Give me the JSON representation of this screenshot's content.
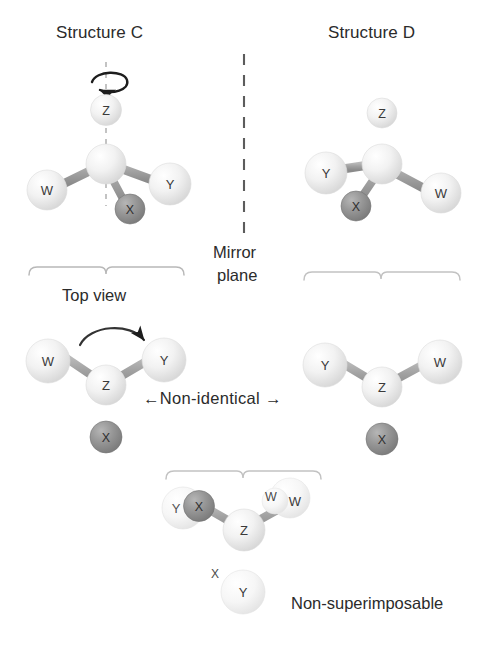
{
  "figure": {
    "title_left": "Structure C",
    "title_right": "Structure D",
    "mirror_label_line1": "Mirror",
    "mirror_label_line2": "plane",
    "top_view_label": "Top view",
    "non_identical_label": "←Non-identical →",
    "non_superimposable_label": "Non-superimposable",
    "colors": {
      "atom_light": "#ededed",
      "atom_light_edge": "#d2d2d2",
      "atom_dark": "#8d8d8d",
      "atom_dark_edge": "#6f6f6f",
      "bond": "#9a9a9a",
      "bracket": "#b4b4b4",
      "text": "#2b2b2b",
      "background": "#ffffff"
    }
  },
  "structures": {
    "structure_c_3d": {
      "name": "Structure C",
      "view": "3d",
      "center_atom": "",
      "atoms": [
        {
          "label": "Z",
          "position": "top",
          "shade": "light"
        },
        {
          "label": "W",
          "position": "left",
          "shade": "light"
        },
        {
          "label": "Y",
          "position": "right",
          "shade": "light"
        },
        {
          "label": "X",
          "position": "bottom-right-wedge",
          "shade": "dark"
        }
      ],
      "has_rotation_arrow": true,
      "has_rotation_axis": true
    },
    "structure_d_3d": {
      "name": "Structure D",
      "view": "3d",
      "center_atom": "",
      "atoms": [
        {
          "label": "Z",
          "position": "top",
          "shade": "light"
        },
        {
          "label": "Y",
          "position": "left",
          "shade": "light"
        },
        {
          "label": "W",
          "position": "right",
          "shade": "light"
        },
        {
          "label": "X",
          "position": "bottom-left-wedge",
          "shade": "dark"
        }
      ],
      "has_rotation_arrow": false,
      "has_rotation_axis": false
    },
    "structure_c_top": {
      "name": "Structure C top view",
      "view": "top",
      "center_atom": "Z",
      "atoms": [
        {
          "label": "W",
          "position": "upper-left",
          "shade": "light"
        },
        {
          "label": "Y",
          "position": "upper-right",
          "shade": "light"
        },
        {
          "label": "X",
          "position": "bottom",
          "shade": "dark"
        }
      ],
      "has_curved_arrow": true
    },
    "structure_d_top": {
      "name": "Structure D top view",
      "view": "top",
      "center_atom": "Z",
      "atoms": [
        {
          "label": "Y",
          "position": "upper-left",
          "shade": "light"
        },
        {
          "label": "W",
          "position": "upper-right",
          "shade": "light"
        },
        {
          "label": "X",
          "position": "bottom",
          "shade": "dark"
        }
      ],
      "has_curved_arrow": false
    },
    "overlay": {
      "name": "Superimposed overlay",
      "view": "top-overlay",
      "center_atom": "Z",
      "atoms": [
        {
          "label": "Y",
          "position": "upper-left-outer",
          "shade": "light"
        },
        {
          "label": "X",
          "position": "upper-left-inner",
          "shade": "dark"
        },
        {
          "label": "W",
          "position": "upper-right-outer",
          "shade": "light"
        },
        {
          "label": "W",
          "position": "upper-right-ghost",
          "shade": "light"
        },
        {
          "label": "Y",
          "position": "bottom",
          "shade": "light"
        },
        {
          "label": "X",
          "position": "bottom-ghost-label",
          "shade": "label-only"
        }
      ]
    }
  },
  "atom_labels": {
    "z": "Z",
    "w": "W",
    "x": "X",
    "y": "Y"
  }
}
